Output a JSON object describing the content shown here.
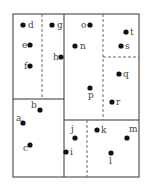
{
  "diagram": {
    "type": "spatial-partition",
    "outer_box": {
      "x1": 13,
      "y1": 14,
      "x2": 139,
      "y2": 177
    },
    "solid_lines": [
      {
        "name": "top-center-vertical",
        "x1": 64,
        "y1": 14,
        "x2": 64,
        "y2": 99
      },
      {
        "name": "left-horizontal",
        "x1": 13,
        "y1": 99,
        "x2": 64,
        "y2": 99
      },
      {
        "name": "right-horizontal",
        "x1": 64,
        "y1": 120,
        "x2": 139,
        "y2": 120
      },
      {
        "name": "bottom-center-vertical",
        "x1": 64,
        "y1": 99,
        "x2": 64,
        "y2": 177
      }
    ],
    "dashed_lines": [
      {
        "name": "top-left-vertical",
        "x1": 42,
        "y1": 14,
        "x2": 42,
        "y2": 99
      },
      {
        "name": "top-right-vertical",
        "x1": 103,
        "y1": 14,
        "x2": 103,
        "y2": 120
      },
      {
        "name": "top-right-horizontal",
        "x1": 103,
        "y1": 57,
        "x2": 139,
        "y2": 57
      },
      {
        "name": "bottom-right-vertical",
        "x1": 87,
        "y1": 120,
        "x2": 87,
        "y2": 177
      }
    ],
    "points": [
      {
        "label": "a",
        "x": 23,
        "y": 123,
        "lx": 16,
        "ly": 121
      },
      {
        "label": "b",
        "x": 40,
        "y": 110,
        "lx": 31,
        "ly": 108
      },
      {
        "label": "c",
        "x": 30,
        "y": 145,
        "lx": 23,
        "ly": 151
      },
      {
        "label": "d",
        "x": 23,
        "y": 25,
        "lx": 28,
        "ly": 28
      },
      {
        "label": "e",
        "x": 30,
        "y": 45,
        "lx": 22,
        "ly": 48
      },
      {
        "label": "f",
        "x": 30,
        "y": 66,
        "lx": 24,
        "ly": 69
      },
      {
        "label": "g",
        "x": 52,
        "y": 25,
        "lx": 57,
        "ly": 28
      },
      {
        "label": "h",
        "x": 61,
        "y": 57,
        "lx": 53,
        "ly": 60
      },
      {
        "label": "i",
        "x": 66,
        "y": 152,
        "lx": 70,
        "ly": 155
      },
      {
        "label": "j",
        "x": 75,
        "y": 138,
        "lx": 71,
        "ly": 132
      },
      {
        "label": "k",
        "x": 97,
        "y": 130,
        "lx": 101,
        "ly": 133
      },
      {
        "label": "l",
        "x": 111,
        "y": 153,
        "lx": 109,
        "ly": 164
      },
      {
        "label": "m",
        "x": 127,
        "y": 138,
        "lx": 129,
        "ly": 132
      },
      {
        "label": "n",
        "x": 75,
        "y": 46,
        "lx": 80,
        "ly": 49
      },
      {
        "label": "o",
        "x": 90,
        "y": 25,
        "lx": 81,
        "ly": 28
      },
      {
        "label": "p",
        "x": 90,
        "y": 88,
        "lx": 88,
        "ly": 98
      },
      {
        "label": "q",
        "x": 119,
        "y": 74,
        "lx": 123,
        "ly": 77
      },
      {
        "label": "r",
        "x": 112,
        "y": 102,
        "lx": 116,
        "ly": 105
      },
      {
        "label": "s",
        "x": 121,
        "y": 46,
        "lx": 125,
        "ly": 49
      },
      {
        "label": "t",
        "x": 126,
        "y": 32,
        "lx": 130,
        "ly": 35
      }
    ]
  }
}
